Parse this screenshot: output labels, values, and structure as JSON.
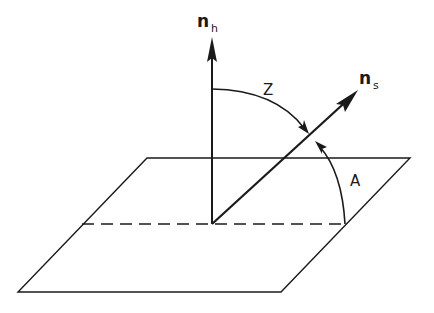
{
  "diagram": {
    "title": "",
    "colors": {
      "ink": "#1a1a1a",
      "background": "#ffffff"
    },
    "vectors": [
      {
        "id": "n_h",
        "symbol": "n",
        "subscript": "h",
        "meaning": "horizontal plane normal (vertical)"
      },
      {
        "id": "n_s",
        "symbol": "n",
        "subscript": "s",
        "meaning": "direction vector toward sun"
      }
    ],
    "angles": [
      {
        "id": "Z",
        "label": "Z",
        "between": [
          "n_h",
          "n_s"
        ]
      },
      {
        "id": "A",
        "label": "A",
        "between": [
          "horizontal plane",
          "n_s"
        ]
      }
    ],
    "plane": {
      "shape": "parallelogram",
      "projection_line": "dashed"
    }
  }
}
